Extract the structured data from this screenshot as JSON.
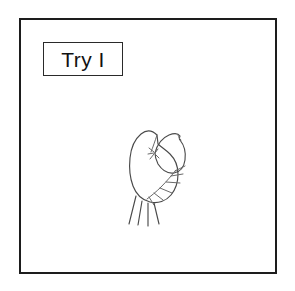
{
  "page": {
    "background_color": "#ffffff",
    "width": 295,
    "height": 291
  },
  "frame": {
    "name": "drawing-frame",
    "border_color": "#1d1d1d",
    "fill_color": "#ffffff"
  },
  "label": {
    "text": "Try I",
    "border_color": "#2a2a2a",
    "text_color": "#111111",
    "background_color": "#ffffff"
  },
  "drawing": {
    "subject": "hand-drawn insect sketch",
    "description": "pencil sketch of a bug with an oval body, a rounded wing-like head at upper right, four straight legs hanging below, and a row of short angled bristle legs along the lower right edge",
    "ink_color": "#4a4a4a",
    "parts": [
      "body-outline",
      "head-outline",
      "head-body-joint",
      "lower-legs",
      "bristle-legs"
    ]
  }
}
